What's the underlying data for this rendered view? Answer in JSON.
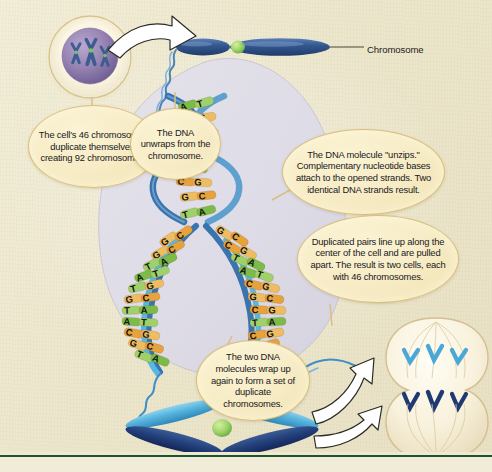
{
  "figure": {
    "background_color": "#ece6cc",
    "baseline_rule_color": "#1d5233"
  },
  "labels": {
    "chromosome": "Chromosome"
  },
  "callouts": [
    {
      "id": "cell-duplication",
      "text": "The cell's 46 chromosomes duplicate themselves, creating 92 chromosomes.",
      "fill": "#f7ecc6",
      "border": "#d9bf7c"
    },
    {
      "id": "dna-unwraps",
      "text": "The DNA unwraps from the chromosome.",
      "fill": "#f7ecc6",
      "border": "#d9bf7c"
    },
    {
      "id": "dna-unzips",
      "text": "The DNA molecule \"unzips.\" Complementary nucleotide bases attach to the opened strands. Two identical DNA strands result.",
      "fill": "#f7ecc6",
      "border": "#d9bf7c"
    },
    {
      "id": "duplicated-pairs",
      "text": "Duplicated pairs line up along the center of the cell and are pulled apart. The result is two cells, each with 46 chromosomes.",
      "fill": "#f7ecc6",
      "border": "#d9bf7c"
    },
    {
      "id": "dna-rewraps",
      "text": "The two DNA molecules wrap up again to form a set of duplicate chromosomes.",
      "fill": "#f7ecc6",
      "border": "#d9bf7c"
    }
  ],
  "structures": {
    "nucleus_cell": {
      "name": "cell-with-chromosomes",
      "nucleus_color": "#8d7aa8",
      "chromosome_color": "#3c5c92",
      "centromere_color": "#7fbf5e",
      "chromosome_count_shown": 3
    },
    "condensed_chromosome": {
      "name": "condensed-chromosome",
      "arm_color": "#2f5288",
      "centromere_color": "#c3e08a"
    },
    "duplicate_chromosome": {
      "name": "duplicate-chromosome-x",
      "light_chromatid_color": "#58b4dd",
      "dark_chromatid_color": "#24407a",
      "centromere_color": "#86c860"
    },
    "dividing_cells": {
      "name": "dividing-cells",
      "cytoplasm_color": "#f6efdc",
      "spindle_color": "#d6c49a",
      "chromatid_light_color": "#4aa8d8",
      "chromatid_dark_color": "#1f3a72"
    },
    "dna_backdrop_color": "#dcdae8",
    "dna_backbone_colors": {
      "parent": "#3a74ae",
      "daughter": "#59b8e2"
    }
  },
  "base_pair_colors": {
    "A": "#7dbb49",
    "T": "#9fd06a",
    "C": "#e8a23c",
    "G": "#f0bc62",
    "letter_color": "#14140f"
  },
  "base_pairs": {
    "upper_helix": [
      [
        "A",
        "T"
      ],
      [
        "C",
        "G"
      ],
      [
        "G",
        "C"
      ],
      [
        "T",
        "A"
      ],
      [
        "T",
        "A"
      ],
      [
        "C",
        "G"
      ],
      [
        "G",
        "C"
      ],
      [
        "T",
        "A"
      ]
    ],
    "fork_left_strand": [
      [
        "G",
        "C"
      ],
      [
        "G",
        "C"
      ],
      [
        "T",
        "A"
      ],
      [
        "A",
        "T"
      ],
      [
        "T",
        "G"
      ],
      [
        "G",
        "C"
      ],
      [
        "T",
        "A"
      ],
      [
        "A",
        "T"
      ],
      [
        "C",
        "G"
      ],
      [
        "G",
        "C"
      ],
      [
        "T",
        "A"
      ]
    ],
    "fork_right_strand": [
      [
        "G",
        "C"
      ],
      [
        "C",
        "G"
      ],
      [
        "T",
        "A"
      ],
      [
        "A",
        "T"
      ],
      [
        "C",
        "G"
      ],
      [
        "G",
        "C"
      ],
      [
        "C",
        "G"
      ],
      [
        "T",
        "A"
      ],
      [
        "C",
        "G"
      ],
      [
        "G",
        "C"
      ],
      [
        "T",
        "A"
      ]
    ]
  },
  "arrows": [
    {
      "id": "arrow-cell-to-chromosome",
      "color": "#ffffff",
      "outline": "#2b2b24"
    },
    {
      "id": "arrow-chromosome-to-cell-upper",
      "color": "#ffffff",
      "outline": "#2b2b24"
    },
    {
      "id": "arrow-chromosome-to-cell-lower",
      "color": "#ffffff",
      "outline": "#2b2b24"
    }
  ]
}
